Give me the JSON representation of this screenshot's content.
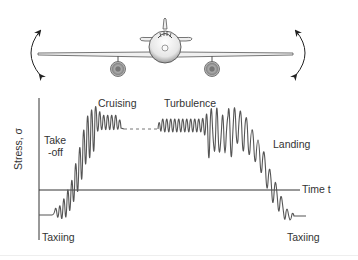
{
  "figure": {
    "airplane": {
      "description": "front view of airplane with wings flexing",
      "left_arrow": "curved-double-arrow",
      "right_arrow": "curved-double-arrow"
    },
    "labels": {
      "y_axis": "Stress, σ",
      "x_axis": "Time t",
      "taxiing_start": "Taxiing",
      "takeoff_line1": "Take",
      "takeoff_line2": "-off",
      "cruising": "Cruising",
      "turbulence": "Turbulence",
      "landing": "Landing",
      "taxiing_end": "Taxiing"
    },
    "colors": {
      "line": "#555555",
      "axis": "#333333",
      "text": "#333333"
    }
  }
}
